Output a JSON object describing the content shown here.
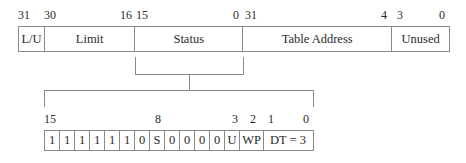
{
  "top_register": {
    "bit_labels": [
      {
        "text": "31",
        "x": 18
      },
      {
        "text": "30",
        "x": 44
      },
      {
        "text": "16",
        "x": 120
      },
      {
        "text": "15",
        "x": 136
      },
      {
        "text": "0",
        "x": 233
      },
      {
        "text": "31",
        "x": 245
      },
      {
        "text": "4",
        "x": 381
      },
      {
        "text": "3",
        "x": 397
      },
      {
        "text": "0",
        "x": 439
      }
    ],
    "fields": [
      {
        "name": "L/U",
        "width": 26
      },
      {
        "name": "Limit",
        "width": 91
      },
      {
        "name": "Status",
        "width": 108
      },
      {
        "name": "Table Address",
        "width": 150
      },
      {
        "name": "Unused",
        "width": 56
      }
    ]
  },
  "status_expansion": {
    "bit_labels": [
      {
        "text": "15",
        "x": 44
      },
      {
        "text": "8",
        "x": 155
      },
      {
        "text": "3",
        "x": 232
      },
      {
        "text": "2",
        "x": 250
      },
      {
        "text": "1",
        "x": 268
      },
      {
        "text": "0",
        "x": 303
      }
    ],
    "cells": [
      {
        "text": "1",
        "width": 15
      },
      {
        "text": "1",
        "width": 15
      },
      {
        "text": "1",
        "width": 15
      },
      {
        "text": "1",
        "width": 15
      },
      {
        "text": "1",
        "width": 15
      },
      {
        "text": "1",
        "width": 15
      },
      {
        "text": "0",
        "width": 15
      },
      {
        "text": "S",
        "width": 15
      },
      {
        "text": "0",
        "width": 15
      },
      {
        "text": "0",
        "width": 15
      },
      {
        "text": "0",
        "width": 15
      },
      {
        "text": "0",
        "width": 15
      },
      {
        "text": "U",
        "width": 15
      },
      {
        "text": "WP",
        "width": 24
      },
      {
        "text": "DT = 3",
        "width": 50
      }
    ]
  }
}
